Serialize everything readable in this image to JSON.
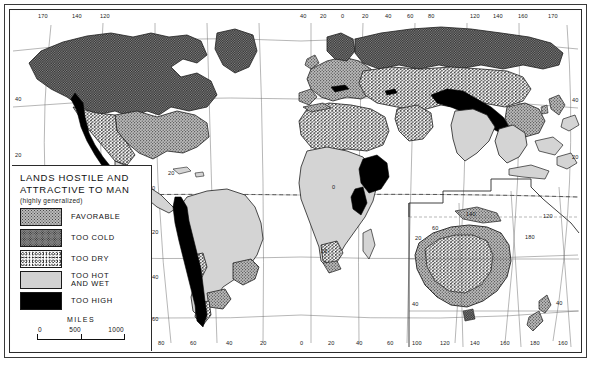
{
  "map": {
    "title_line1": "LANDS HOSTILE AND",
    "title_line2": "ATTRACTIVE TO MAN",
    "subtitle": "(highly generalized)",
    "projection_note": "world map with Oceania inset",
    "legend": [
      {
        "key": "favorable",
        "label": "FAVORABLE",
        "pattern": "medium-stipple",
        "color": "#b9b9b9"
      },
      {
        "key": "too_cold",
        "label": "TOO COLD",
        "pattern": "dense-stipple",
        "color": "#8b8b8b"
      },
      {
        "key": "too_dry",
        "label": "TOO DRY",
        "pattern": "sparse-speckle",
        "color": "#ffffff"
      },
      {
        "key": "too_hot",
        "label": "TOO HOT\nAND WET",
        "label_line1": "TOO HOT",
        "label_line2": "AND WET",
        "pattern": "flat-light-gray",
        "color": "#d2d2d2"
      },
      {
        "key": "too_high",
        "label": "TOO HIGH",
        "pattern": "solid-black",
        "color": "#000000"
      }
    ],
    "scale": {
      "title": "MILES",
      "ticks": [
        "0",
        "500",
        "1000"
      ]
    },
    "graticule": {
      "top_labels": [
        "170",
        "140",
        "120",
        "40",
        "20",
        "0",
        "20",
        "40",
        "60",
        "80",
        "120",
        "140",
        "160",
        "170"
      ],
      "bottom_labels": [
        "100",
        "80",
        "60",
        "40",
        "20",
        "0",
        "20",
        "40",
        "60",
        "100",
        "120",
        "140",
        "160",
        "180",
        "160"
      ],
      "left_labels": [
        "40",
        "20"
      ],
      "right_labels": [
        "40",
        "20"
      ],
      "interior_labels": [
        "0",
        "20",
        "40",
        "60",
        "60",
        "20",
        "120",
        "180"
      ],
      "equator_style": "dashed",
      "ocean_color": "#ffffff",
      "line_color": "#3a3a3a"
    },
    "top_ticks": [
      {
        "label": "170",
        "x": 38
      },
      {
        "label": "140",
        "x": 72
      },
      {
        "label": "120",
        "x": 100
      },
      {
        "label": "40",
        "x": 300
      },
      {
        "label": "20",
        "x": 320
      },
      {
        "label": "0",
        "x": 340
      },
      {
        "label": "20",
        "x": 362
      },
      {
        "label": "40",
        "x": 385
      },
      {
        "label": "60",
        "x": 407
      },
      {
        "label": "80",
        "x": 428
      },
      {
        "label": "120",
        "x": 470
      },
      {
        "label": "140",
        "x": 493
      },
      {
        "label": "160",
        "x": 518
      },
      {
        "label": "170",
        "x": 548
      }
    ],
    "bottom_ticks": [
      {
        "label": "100",
        "x": 116
      },
      {
        "label": "80",
        "x": 158
      },
      {
        "label": "60",
        "x": 190
      },
      {
        "label": "40",
        "x": 226
      },
      {
        "label": "20",
        "x": 260
      },
      {
        "label": "0",
        "x": 300
      },
      {
        "label": "20",
        "x": 328
      },
      {
        "label": "40",
        "x": 356
      },
      {
        "label": "60",
        "x": 387
      },
      {
        "label": "100",
        "x": 412
      },
      {
        "label": "120",
        "x": 440
      },
      {
        "label": "140",
        "x": 470
      },
      {
        "label": "160",
        "x": 500
      },
      {
        "label": "180",
        "x": 530
      },
      {
        "label": "160",
        "x": 558
      }
    ],
    "left_ticks": [
      {
        "label": "40",
        "y": 96
      },
      {
        "label": "20",
        "y": 152
      }
    ],
    "right_ticks": [
      {
        "label": "40",
        "y": 97
      },
      {
        "label": "20",
        "y": 154
      }
    ],
    "interior_ticks": [
      {
        "label": "0",
        "x": 152,
        "y": 187
      },
      {
        "label": "20",
        "x": 152,
        "y": 231
      },
      {
        "label": "40",
        "x": 152,
        "y": 276
      },
      {
        "label": "60",
        "x": 152,
        "y": 318
      },
      {
        "label": "20",
        "x": 168,
        "y": 172
      },
      {
        "label": "20",
        "x": 321,
        "y": 250
      },
      {
        "label": "0",
        "x": 332,
        "y": 186
      },
      {
        "label": "60",
        "x": 432,
        "y": 227
      },
      {
        "label": "20",
        "x": 415,
        "y": 237
      },
      {
        "label": "140",
        "x": 466,
        "y": 213
      },
      {
        "label": "180",
        "x": 525,
        "y": 236
      },
      {
        "label": "120",
        "x": 543,
        "y": 215
      },
      {
        "label": "40",
        "x": 412,
        "y": 303
      },
      {
        "label": "40",
        "x": 556,
        "y": 302
      }
    ]
  },
  "regions": {
    "too_cold": [
      "Alaska",
      "Northern Canada",
      "Greenland",
      "Scandinavia",
      "Siberia",
      "Patagonia-highlands",
      "Tasmania-south"
    ],
    "favorable": [
      "Eastern United States",
      "Western Europe",
      "Eastern China",
      "Japan",
      "Southeast Australia",
      "Southern Brazil",
      "New Zealand"
    ],
    "too_dry": [
      "Western United States",
      "Northern Mexico",
      "Sahara",
      "Arabia",
      "Central Asia",
      "Interior Australia",
      "Atacama",
      "Kalahari"
    ],
    "too_hot": [
      "Amazon Basin",
      "Congo Basin",
      "India",
      "Southeast Asia",
      "Indonesia",
      "West Africa",
      "Central America"
    ],
    "too_high": [
      "Rocky Mountains",
      "Sierra Nevada",
      "Andes",
      "Himalaya",
      "Tibetan Plateau",
      "Ethiopian Highlands",
      "Caucasus"
    ]
  }
}
